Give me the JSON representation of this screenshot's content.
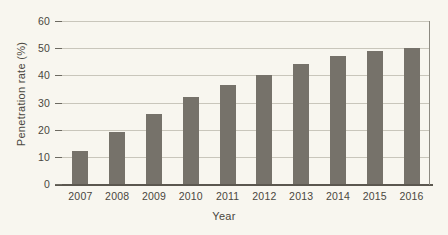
{
  "chart_data": {
    "type": "bar",
    "title": "",
    "subtitle": "",
    "xlabel": "Year",
    "ylabel": "Penetration rate (%)",
    "categories": [
      "2007",
      "2008",
      "2009",
      "2010",
      "2011",
      "2012",
      "2013",
      "2014",
      "2015",
      "2016"
    ],
    "values": [
      12.3,
      19.2,
      25.7,
      32.0,
      36.3,
      40.0,
      44.2,
      47.0,
      48.8,
      50.2
    ],
    "series": [
      {
        "name": "Penetration rate",
        "values": [
          12.3,
          19.2,
          25.7,
          32.0,
          36.3,
          40.0,
          44.2,
          47.0,
          48.8,
          50.2
        ]
      }
    ],
    "ylim": [
      0,
      60
    ],
    "yticks": [
      0,
      10,
      20,
      30,
      40,
      50,
      60
    ],
    "ytick_labels": [
      "0",
      "10",
      "20",
      "30",
      "40",
      "50",
      "60"
    ],
    "grid": "horizontal",
    "legend": "none",
    "bar_color": "#76726a",
    "background_color": "#f8f6ef",
    "gridline_color": "#c9c6bb",
    "axis_color": "#5b574f",
    "text_color": "#4a4740"
  }
}
